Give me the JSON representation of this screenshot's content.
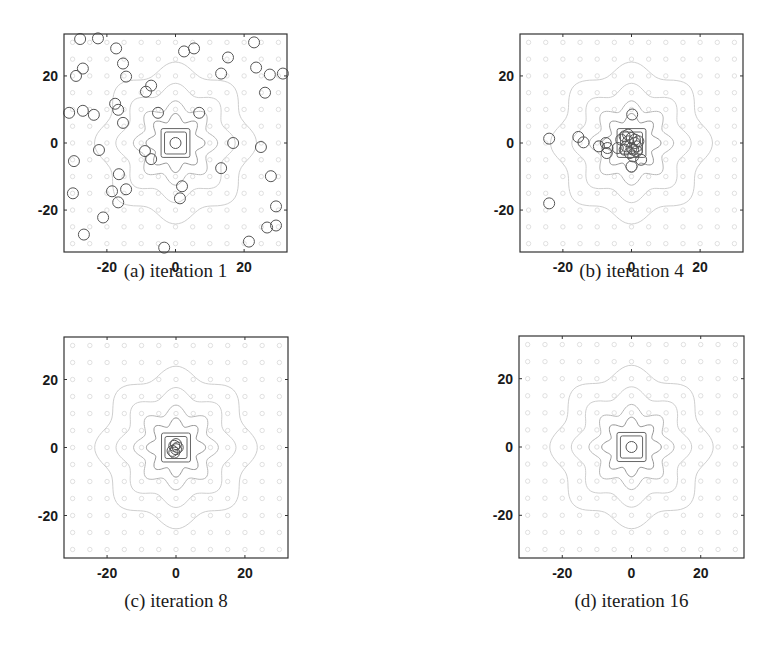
{
  "figure": {
    "panels": [
      {
        "id": "a",
        "caption": "(a) iteration 1"
      },
      {
        "id": "b",
        "caption": "(b) iteration 4"
      },
      {
        "id": "c",
        "caption": "(c) iteration 8"
      },
      {
        "id": "d",
        "caption": "(d) iteration 16"
      }
    ]
  },
  "chart_data": [
    {
      "type": "scatter",
      "title": "(a) iteration 1",
      "xlabel": "",
      "ylabel": "",
      "xlim": [
        -32.5,
        32.5
      ],
      "ylim": [
        -32.5,
        32.5
      ],
      "xticks": [
        -20,
        0,
        20
      ],
      "yticks": [
        -20,
        0,
        20
      ],
      "background": "contour plot of objective function centered at (0,0)",
      "marker": "open-circle",
      "points": [
        [
          -27.8,
          31
        ],
        [
          -22.6,
          31.2
        ],
        [
          -17.3,
          28.2
        ],
        [
          2.5,
          27.3
        ],
        [
          5.4,
          28.2
        ],
        [
          22.9,
          30
        ],
        [
          15.3,
          25.5
        ],
        [
          -15.3,
          23.7
        ],
        [
          -27,
          22.2
        ],
        [
          -29,
          20
        ],
        [
          -14.4,
          19.8
        ],
        [
          13.3,
          20.7
        ],
        [
          23.5,
          22.5
        ],
        [
          27.5,
          20.4
        ],
        [
          31.3,
          20.7
        ],
        [
          26.1,
          15
        ],
        [
          -7.1,
          17.1
        ],
        [
          -8.6,
          15.3
        ],
        [
          -31,
          9
        ],
        [
          -27,
          9.6
        ],
        [
          -23.8,
          8.4
        ],
        [
          -17.6,
          11.7
        ],
        [
          -16.7,
          9.9
        ],
        [
          -15.3,
          6
        ],
        [
          -5.1,
          9
        ],
        [
          6.9,
          9
        ],
        [
          0,
          0
        ],
        [
          -8.9,
          -2.4
        ],
        [
          -7.1,
          -4.8
        ],
        [
          -22.3,
          -2.1
        ],
        [
          -29.6,
          -5.4
        ],
        [
          16.8,
          0
        ],
        [
          24.9,
          -1.2
        ],
        [
          13.3,
          -7.5
        ],
        [
          -16.5,
          -9.3
        ],
        [
          27.8,
          -9.9
        ],
        [
          -29.9,
          -15
        ],
        [
          -18.5,
          -14.4
        ],
        [
          -14.4,
          -13.8
        ],
        [
          -16.7,
          -17.7
        ],
        [
          1.9,
          -12.9
        ],
        [
          1.3,
          -16.5
        ],
        [
          29.3,
          -18.9
        ],
        [
          -21.1,
          -22.2
        ],
        [
          26.7,
          -25.2
        ],
        [
          29.3,
          -24.6
        ],
        [
          -26.7,
          -27.3
        ],
        [
          21.4,
          -29.4
        ],
        [
          -3.3,
          -31.2
        ]
      ]
    },
    {
      "type": "scatter",
      "title": "(b) iteration 4",
      "xlabel": "",
      "ylabel": "",
      "xlim": [
        -32.5,
        32.5
      ],
      "ylim": [
        -32.5,
        32.5
      ],
      "xticks": [
        -20,
        0,
        20
      ],
      "yticks": [
        -20,
        0,
        20
      ],
      "marker": "open-circle",
      "points": [
        [
          -24,
          1.3
        ],
        [
          -15.5,
          1.8
        ],
        [
          -14,
          0.2
        ],
        [
          -9.5,
          -1
        ],
        [
          -7.5,
          0
        ],
        [
          -7,
          -1.5
        ],
        [
          -7.2,
          -3
        ],
        [
          0.2,
          8.5
        ],
        [
          0,
          -7
        ],
        [
          2.8,
          -5
        ],
        [
          -4,
          -1.5
        ],
        [
          -3,
          1
        ],
        [
          -2,
          2
        ],
        [
          -1,
          0.5
        ],
        [
          0,
          1.5
        ],
        [
          1,
          0
        ],
        [
          1.5,
          -1
        ],
        [
          0.5,
          -2
        ],
        [
          -0.5,
          -3
        ],
        [
          -1.5,
          -1
        ],
        [
          0,
          -1.5
        ],
        [
          1,
          1
        ],
        [
          -1,
          2.5
        ],
        [
          2,
          0.5
        ],
        [
          -2,
          -2
        ],
        [
          0.5,
          -4
        ],
        [
          1.5,
          -2.5
        ],
        [
          -24,
          -18
        ]
      ]
    },
    {
      "type": "scatter",
      "title": "(c) iteration 8",
      "xlabel": "",
      "ylabel": "",
      "xlim": [
        -32.5,
        32.5
      ],
      "ylim": [
        -32.5,
        32.5
      ],
      "xticks": [
        -20,
        0,
        20
      ],
      "yticks": [
        -20,
        0,
        20
      ],
      "marker": "open-circle",
      "points": [
        [
          -0.5,
          0.5
        ],
        [
          0,
          -0.5
        ],
        [
          -1,
          -1
        ],
        [
          0.5,
          0
        ],
        [
          -0.5,
          -1.5
        ],
        [
          0,
          1
        ]
      ]
    },
    {
      "type": "scatter",
      "title": "(d) iteration 16",
      "xlabel": "",
      "ylabel": "",
      "xlim": [
        -32.5,
        32.5
      ],
      "ylim": [
        -32.5,
        32.5
      ],
      "xticks": [
        -20,
        0,
        20
      ],
      "yticks": [
        -20,
        0,
        20
      ],
      "marker": "open-circle",
      "points": [
        [
          0,
          0
        ]
      ]
    }
  ],
  "layout": {
    "frames": [
      {
        "x": 64,
        "y": 34,
        "w": 223,
        "h": 218
      },
      {
        "x": 520,
        "y": 34,
        "w": 223,
        "h": 218
      },
      {
        "x": 64,
        "y": 337,
        "w": 224,
        "h": 221
      },
      {
        "x": 519,
        "y": 336,
        "w": 225,
        "h": 222
      }
    ],
    "colors": {
      "frame": "#333333",
      "marker": "#555555",
      "contour_dark": "#666666",
      "contour_light": "#c8c8c8",
      "dots": "#d8d8d8"
    }
  }
}
